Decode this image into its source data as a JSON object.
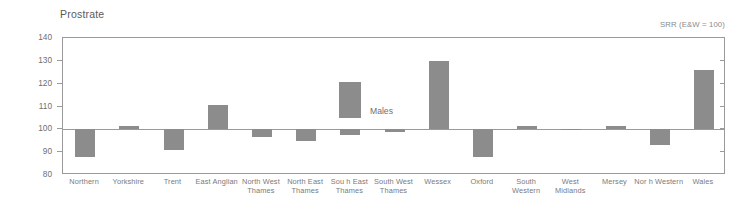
{
  "chart_data": {
    "type": "bar",
    "title": "Prostrate",
    "annotation": "SRR (E&W = 100)",
    "legend": {
      "label": "Males",
      "position": "inside-top-center",
      "color": "#8c8c8c"
    },
    "xlabel": "",
    "ylabel": "",
    "ylim": [
      80,
      140
    ],
    "yticks": [
      80,
      90,
      100,
      110,
      120,
      130,
      140
    ],
    "ytick_labels": [
      "80",
      "90",
      "100",
      "110",
      "120",
      "130",
      "140"
    ],
    "baseline": 100,
    "grid": false,
    "categories": [
      "Northern",
      "Yorkshire",
      "Trent",
      "East Anglian",
      "North West\nThames",
      "North East\nThames",
      "Sou h East\nThames",
      "South West\nThames",
      "Wessex",
      "Oxford",
      "South\nWestern",
      "West\nMidlands",
      "Mersey",
      "Nor h Western",
      "Wales"
    ],
    "series": [
      {
        "name": "Males",
        "values": [
          88,
          101.5,
          91,
          110.5,
          96.5,
          95,
          97.5,
          99,
          130,
          88,
          101.5,
          99.5,
          101.5,
          93,
          126
        ]
      }
    ]
  },
  "colors": {
    "bar": "#8c8c8c",
    "axis": "#9a9a9a",
    "text": "#6f6f6f",
    "title": "#5a5a5a"
  }
}
